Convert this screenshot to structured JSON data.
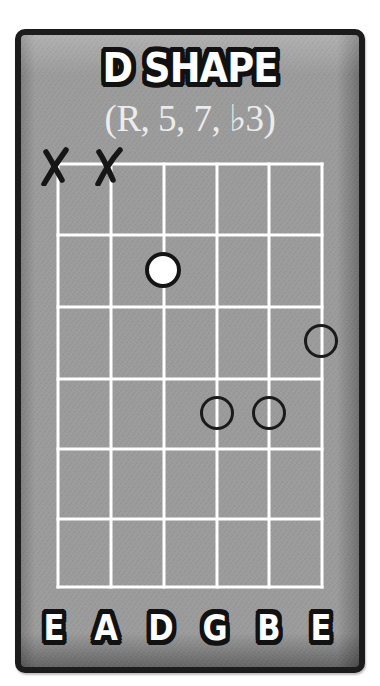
{
  "diagram": {
    "type": "guitar-chord-diagram",
    "title": "D SHAPE",
    "subtitle": "(R, 5, 7, ♭3)",
    "colors": {
      "frame_border": "#1c1c1c",
      "background": "#9b9b9b",
      "grid_lines": "#ffffff",
      "root_fill": "#ffffff",
      "marker_outline": "#141414",
      "label_text": "#ffffff"
    },
    "strings": [
      {
        "index": 0,
        "label": "E",
        "muted": true
      },
      {
        "index": 1,
        "label": "A",
        "muted": true
      },
      {
        "index": 2,
        "label": "D",
        "muted": false
      },
      {
        "index": 3,
        "label": "G",
        "muted": false
      },
      {
        "index": 4,
        "label": "B",
        "muted": false
      },
      {
        "index": 5,
        "label": "E",
        "muted": false
      }
    ],
    "fret_rows": 6,
    "mute_symbol": "X",
    "notes": [
      {
        "string": "D",
        "string_index": 2,
        "fret": 2,
        "type": "root",
        "interval": "R"
      },
      {
        "string": "E",
        "string_index": 5,
        "fret": 3,
        "type": "interval",
        "interval": "♭3"
      },
      {
        "string": "G",
        "string_index": 3,
        "fret": 4,
        "type": "interval",
        "interval": "5"
      },
      {
        "string": "B",
        "string_index": 4,
        "fret": 4,
        "type": "interval",
        "interval": "7"
      }
    ]
  }
}
